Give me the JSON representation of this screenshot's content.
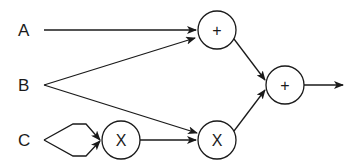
{
  "diagram": {
    "inputs": [
      {
        "id": "A",
        "label": "A",
        "x": 24,
        "y": 30
      },
      {
        "id": "B",
        "label": "B",
        "x": 24,
        "y": 85
      },
      {
        "id": "C",
        "label": "C",
        "x": 24,
        "y": 140
      }
    ],
    "nodes": [
      {
        "id": "add1",
        "label": "+",
        "cx": 217,
        "cy": 30
      },
      {
        "id": "mul1",
        "label": "X",
        "cx": 121,
        "cy": 140
      },
      {
        "id": "mul2",
        "label": "X",
        "cx": 217,
        "cy": 140
      },
      {
        "id": "add2",
        "label": "+",
        "cx": 285,
        "cy": 85
      }
    ],
    "edges": [
      {
        "from": "A",
        "to": "add1"
      },
      {
        "from": "B",
        "to": "add1"
      },
      {
        "from": "B",
        "to": "mul2"
      },
      {
        "from": "C",
        "to": "mul1",
        "note": "two paths (C used twice)"
      },
      {
        "from": "mul1",
        "to": "mul2"
      },
      {
        "from": "add1",
        "to": "add2"
      },
      {
        "from": "mul2",
        "to": "add2"
      },
      {
        "from": "add2",
        "to": "output"
      }
    ]
  }
}
